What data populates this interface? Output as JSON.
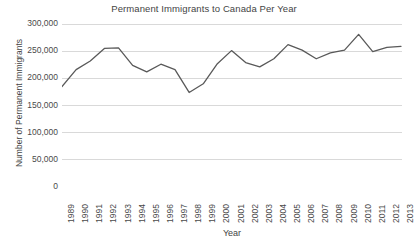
{
  "chart_data": {
    "type": "line",
    "title": "Permanent Immigrants to Canada Per Year",
    "xlabel": "Year",
    "ylabel": "Number of Permanent Immigrants",
    "grid": true,
    "legend": "none",
    "ylim": [
      0,
      300000
    ],
    "ytick_labels": [
      "300,000",
      "250,000",
      "200,000",
      "150,000",
      "100,000",
      "50,000",
      "0"
    ],
    "ytick_values": [
      300000,
      250000,
      200000,
      150000,
      100000,
      50000,
      0
    ],
    "categories": [
      "1989",
      "1990",
      "1991",
      "1992",
      "1993",
      "1994",
      "1995",
      "1996",
      "1997",
      "1998",
      "1999",
      "2000",
      "2001",
      "2002",
      "2003",
      "2004",
      "2005",
      "2006",
      "2007",
      "2008",
      "2009",
      "2010",
      "2011",
      "2012",
      "2013"
    ],
    "series": [
      {
        "name": "Permanent Immigrants",
        "color": "#595959",
        "values": [
          185000,
          216000,
          232000,
          255000,
          256000,
          224000,
          212000,
          226000,
          216000,
          174000,
          190000,
          227000,
          251000,
          229000,
          221000,
          236000,
          262000,
          252000,
          236000,
          247000,
          252000,
          281000,
          249000,
          257000,
          259000
        ]
      }
    ]
  }
}
